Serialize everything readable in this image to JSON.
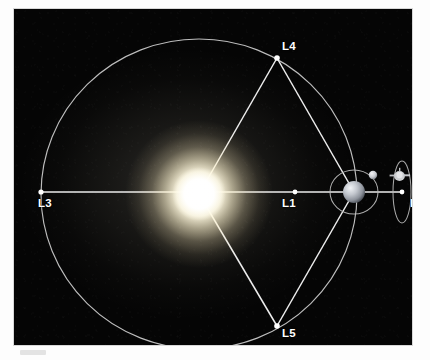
{
  "figure": {
    "background_color": "#050505",
    "line_color": "#e8e8e8",
    "label_color": "#ffffff",
    "sun_color": "#fffbe8",
    "earth_color": "#c9ccd2",
    "moon_color": "#cfd2d6",
    "spacecraft_color": "#dcdcdc"
  },
  "bodies": {
    "sun": {
      "name": "Sun",
      "cx": 185,
      "cy": 185,
      "radius": 26
    },
    "earth": {
      "name": "Earth",
      "cx": 340,
      "cy": 183,
      "radius": 11
    },
    "moon": {
      "name": "Moon",
      "cx": 359,
      "cy": 166,
      "radius": 4
    },
    "spacecraft": {
      "name": "Spacecraft",
      "cx": 386,
      "cy": 168
    }
  },
  "orbits": {
    "earth_orbit": {
      "label": "Earth orbit around Sun",
      "cx": 185,
      "cy": 185,
      "rx": 158,
      "ry": 155
    },
    "moon_orbit": {
      "label": "Moon orbit around Earth",
      "cx": 340,
      "cy": 183,
      "rx": 24,
      "ry": 22
    },
    "halo_orbit": {
      "label": "Halo orbit at L2",
      "cx": 388,
      "cy": 183,
      "rx": 9,
      "ry": 31
    }
  },
  "lagrange_points": [
    {
      "id": "L1",
      "label": "L1",
      "x": 281,
      "y": 183,
      "label_x": 268,
      "label_y": 188,
      "description": "Between Sun and Earth"
    },
    {
      "id": "L2",
      "label": "L2",
      "x": 388,
      "y": 183,
      "label_x": 396,
      "label_y": 188,
      "description": "Beyond Earth, anti-Sun side"
    },
    {
      "id": "L3",
      "label": "L3",
      "x": 27,
      "y": 183,
      "label_x": 24,
      "label_y": 188,
      "description": "Opposite side of Sun from Earth"
    },
    {
      "id": "L4",
      "label": "L4",
      "x": 263,
      "y": 49,
      "label_x": 268,
      "label_y": 31,
      "description": "60 degrees ahead of Earth"
    },
    {
      "id": "L5",
      "label": "L5",
      "x": 263,
      "y": 317,
      "label_x": 268,
      "label_y": 318,
      "description": "60 degrees behind Earth"
    }
  ],
  "connector_lines": [
    {
      "name": "sun-earth-axis",
      "from": "L3",
      "to": "L2"
    },
    {
      "name": "sun-to-l4",
      "from": "sun",
      "to": "L4"
    },
    {
      "name": "sun-to-l5",
      "from": "sun",
      "to": "L5"
    },
    {
      "name": "l4-to-earth",
      "from": "L4",
      "to": "earth"
    },
    {
      "name": "l5-to-earth",
      "from": "L5",
      "to": "earth"
    }
  ]
}
